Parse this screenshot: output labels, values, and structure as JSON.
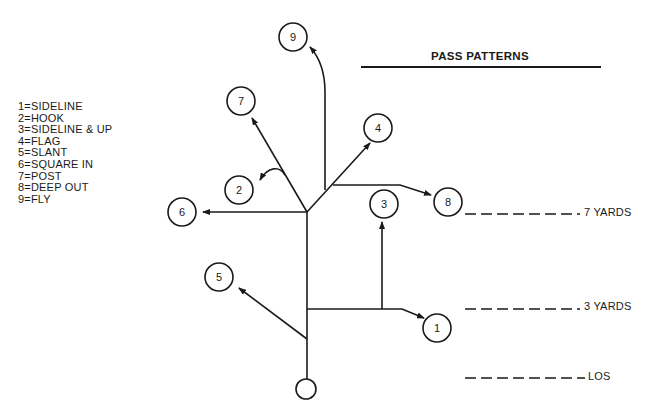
{
  "title": "PASS PATTERNS",
  "legend": [
    {
      "number": "1",
      "label": "1=SIDELINE"
    },
    {
      "number": "2",
      "label": "2=HOOK"
    },
    {
      "number": "3",
      "label": "3=SIDELINE & UP"
    },
    {
      "number": "4",
      "label": "4=FLAG"
    },
    {
      "number": "5",
      "label": "5=SLANT"
    },
    {
      "number": "6",
      "label": "6=SQUARE IN"
    },
    {
      "number": "7",
      "label": "7=POST"
    },
    {
      "number": "8",
      "label": "8=DEEP OUT"
    },
    {
      "number": "9",
      "label": "9=FLY"
    }
  ],
  "yard_lines": [
    {
      "label": "7 YARDS"
    },
    {
      "label": "3 YARDS"
    },
    {
      "label": "LOS"
    }
  ],
  "route_markers": {
    "r1": "1",
    "r2": "2",
    "r3": "3",
    "r4": "4",
    "r5": "5",
    "r6": "6",
    "r7": "7",
    "r8": "8",
    "r9": "9"
  },
  "colors": {
    "ink": "#1a1a1a",
    "background": "#ffffff"
  }
}
